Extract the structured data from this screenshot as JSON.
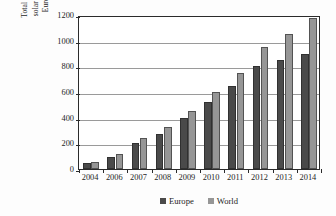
{
  "chart_data": {
    "type": "bar",
    "title": "",
    "subtitle": "",
    "xlabel": "",
    "ylabel": "Total amount of installed solar cooling systems in Europe and the world",
    "ylabel_lines": [
      "Total amount of installed",
      "solar cooling systems in",
      "Europe and the world"
    ],
    "categories": [
      "2004",
      "2006",
      "2007",
      "2008",
      "2009",
      "2010",
      "2011",
      "2012",
      "2013",
      "2014"
    ],
    "series": [
      {
        "name": "Europe",
        "color": "#4a4a4a",
        "values": [
          50,
          95,
          200,
          275,
          400,
          525,
          650,
          800,
          850,
          900
        ]
      },
      {
        "name": "World",
        "color": "#969696",
        "values": [
          55,
          115,
          245,
          325,
          450,
          600,
          745,
          950,
          1050,
          1175
        ]
      }
    ],
    "ylim": [
      0,
      1200
    ],
    "yticks": [
      0,
      200,
      400,
      600,
      800,
      1000,
      1200
    ],
    "ytick_labels": [
      "0",
      "200",
      "400",
      "600",
      "800",
      "1000",
      "1200"
    ],
    "grid": "horizontal",
    "legend_position": "bottom-center",
    "legend": [
      {
        "label": "Europe",
        "swatch": "europe"
      },
      {
        "label": "World",
        "swatch": "world"
      }
    ]
  }
}
